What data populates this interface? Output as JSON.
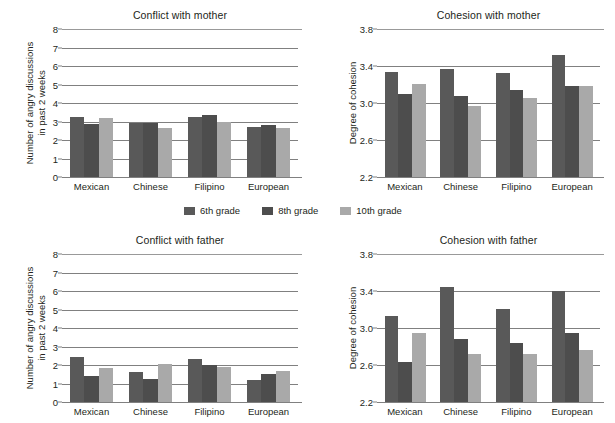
{
  "legend": {
    "items": [
      {
        "label": "6th grade",
        "key": "g6",
        "color": "#595959"
      },
      {
        "label": "8th grade",
        "key": "g8",
        "color": "#4d4d4d"
      },
      {
        "label": "10th grade",
        "key": "g10",
        "color": "#a9a9a9"
      }
    ]
  },
  "chart_data": [
    {
      "type": "bar",
      "id": "conflict-mother",
      "title": "Conflict with mother",
      "xlabel": "",
      "ylabel": "Number of angry discussions in past 2 weeks",
      "ylabel_lines": [
        "Number of angry discussions",
        "in past 2 weeks"
      ],
      "categories": [
        "Mexican",
        "Chinese",
        "Filipino",
        "European"
      ],
      "yticks": [
        0,
        1,
        2,
        3,
        4,
        5,
        6,
        7,
        8
      ],
      "ytick_labels": [
        "0",
        "1",
        "2",
        "3",
        "4",
        "5",
        "6",
        "7",
        "8"
      ],
      "ylim": [
        0,
        8
      ],
      "grid": true,
      "legend_position": "below-figure",
      "series": [
        {
          "name": "6th grade",
          "values": [
            3.22,
            2.93,
            3.22,
            2.73
          ]
        },
        {
          "name": "8th grade",
          "values": [
            2.88,
            2.93,
            3.33,
            2.83
          ]
        },
        {
          "name": "10th grade",
          "values": [
            3.18,
            2.65,
            2.98,
            2.65
          ]
        }
      ]
    },
    {
      "type": "bar",
      "id": "cohesion-mother",
      "title": "Cohesion with mother",
      "xlabel": "",
      "ylabel": "Degree of cohesion",
      "ylabel_lines": [
        "Degree of cohesion"
      ],
      "categories": [
        "Mexican",
        "Chinese",
        "Filipino",
        "European"
      ],
      "yticks": [
        2.2,
        2.6,
        3.0,
        3.4,
        3.8
      ],
      "ytick_labels": [
        "2.2",
        "2.6",
        "3.0",
        "3.4",
        "3.8"
      ],
      "ylim": [
        2.2,
        3.8
      ],
      "grid": true,
      "legend_position": "below-figure",
      "series": [
        {
          "name": "6th grade",
          "values": [
            3.33,
            3.37,
            3.32,
            3.52
          ]
        },
        {
          "name": "8th grade",
          "values": [
            3.1,
            3.08,
            3.14,
            3.18
          ]
        },
        {
          "name": "10th grade",
          "values": [
            3.21,
            2.97,
            3.05,
            3.18
          ]
        }
      ]
    },
    {
      "type": "bar",
      "id": "conflict-father",
      "title": "Conflict with father",
      "xlabel": "",
      "ylabel": "Number of angry discussions in past 2 weeks",
      "ylabel_lines": [
        "Number of angry discussions",
        "in past 2 weeks"
      ],
      "categories": [
        "Mexican",
        "Chinese",
        "Filipino",
        "European"
      ],
      "yticks": [
        0,
        1,
        2,
        3,
        4,
        5,
        6,
        7,
        8
      ],
      "ytick_labels": [
        "0",
        "1",
        "2",
        "3",
        "4",
        "5",
        "6",
        "7",
        "8"
      ],
      "ylim": [
        0,
        8
      ],
      "grid": true,
      "legend_position": "below-figure",
      "series": [
        {
          "name": "6th grade",
          "values": [
            2.45,
            1.62,
            2.33,
            1.18
          ]
        },
        {
          "name": "8th grade",
          "values": [
            1.4,
            1.27,
            2.0,
            1.5
          ]
        },
        {
          "name": "10th grade",
          "values": [
            1.85,
            2.07,
            1.88,
            1.68
          ]
        }
      ]
    },
    {
      "type": "bar",
      "id": "cohesion-father",
      "title": "Cohesion with father",
      "xlabel": "",
      "ylabel": "Degree of cohesion",
      "ylabel_lines": [
        "Degree of cohesion"
      ],
      "categories": [
        "Mexican",
        "Chinese",
        "Filipino",
        "European"
      ],
      "yticks": [
        2.2,
        2.6,
        3.0,
        3.4,
        3.8
      ],
      "ytick_labels": [
        "2.2",
        "2.6",
        "3.0",
        "3.4",
        "3.8"
      ],
      "ylim": [
        2.2,
        3.8
      ],
      "grid": true,
      "legend_position": "below-figure",
      "series": [
        {
          "name": "6th grade",
          "values": [
            3.13,
            3.44,
            3.21,
            3.4
          ]
        },
        {
          "name": "8th grade",
          "values": [
            2.63,
            2.88,
            2.84,
            2.95
          ]
        },
        {
          "name": "10th grade",
          "values": [
            2.95,
            2.72,
            2.72,
            2.76
          ]
        }
      ]
    }
  ]
}
